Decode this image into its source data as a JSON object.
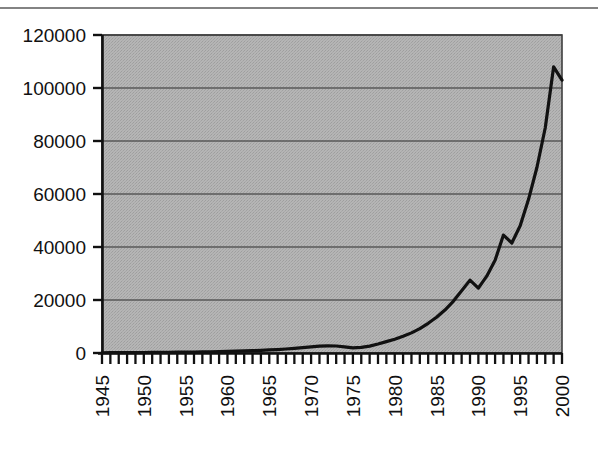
{
  "chart_data": {
    "type": "line",
    "title": "",
    "subtitle": "",
    "xlabel": "",
    "ylabel": "",
    "xlim": [
      1945,
      2000
    ],
    "ylim": [
      0,
      120000
    ],
    "grid": true,
    "legend": false,
    "legend_position": "none",
    "y_ticks": [
      0,
      20000,
      40000,
      60000,
      80000,
      100000,
      120000
    ],
    "y_tick_labels": [
      "0",
      "20000",
      "40000",
      "60000",
      "80000",
      "100000",
      "120000"
    ],
    "x_ticks": [
      1945,
      1950,
      1955,
      1960,
      1965,
      1970,
      1975,
      1980,
      1985,
      1990,
      1995,
      2000
    ],
    "x_tick_labels": [
      "1945",
      "1950",
      "1955",
      "1960",
      "1965",
      "1970",
      "1975",
      "1980",
      "1985",
      "1990",
      "1995",
      "2000"
    ],
    "x_minor_tick_interval": 1,
    "x_label_rotation": -90,
    "series": [
      {
        "name": "",
        "color": "#111111",
        "line_width": 3.2,
        "x": [
          1945,
          1946,
          1947,
          1948,
          1949,
          1950,
          1951,
          1952,
          1953,
          1954,
          1955,
          1956,
          1957,
          1958,
          1959,
          1960,
          1961,
          1962,
          1963,
          1964,
          1965,
          1966,
          1967,
          1968,
          1969,
          1970,
          1971,
          1972,
          1973,
          1974,
          1975,
          1976,
          1977,
          1978,
          1979,
          1980,
          1981,
          1982,
          1983,
          1984,
          1985,
          1986,
          1987,
          1988,
          1989,
          1990,
          1991,
          1992,
          1993,
          1994,
          1995,
          1996,
          1997,
          1998,
          1999,
          2000
        ],
        "values": [
          100,
          110,
          120,
          140,
          160,
          180,
          200,
          230,
          260,
          300,
          340,
          380,
          430,
          480,
          540,
          600,
          700,
          800,
          900,
          1000,
          1150,
          1300,
          1500,
          1750,
          2000,
          2300,
          2600,
          2700,
          2650,
          2300,
          1900,
          2100,
          2600,
          3400,
          4300,
          5200,
          6300,
          7600,
          9200,
          11200,
          13500,
          16200,
          19500,
          23500,
          27500,
          24500,
          29000,
          35000,
          44500,
          41500,
          48000,
          58000,
          70000,
          85000,
          108000,
          103000
        ]
      }
    ],
    "annotations": [
      {
        "label": "local-peak",
        "x": 1972,
        "y": 2700
      },
      {
        "label": "dip-1990",
        "x": 1990,
        "y": 24500
      },
      {
        "label": "dip-1994",
        "x": 1994,
        "y": 41500
      },
      {
        "label": "peak-1999",
        "x": 1999,
        "y": 108000
      }
    ]
  },
  "plot": {
    "background_color": "#b3b3b3",
    "border_color": "#3a3a3a",
    "gridline_color": "#595959",
    "axis_color": "#1a1a1a",
    "page_background": "#ffffff"
  },
  "geometry": {
    "left": 102,
    "right": 562,
    "top": 35,
    "bottom": 353
  }
}
